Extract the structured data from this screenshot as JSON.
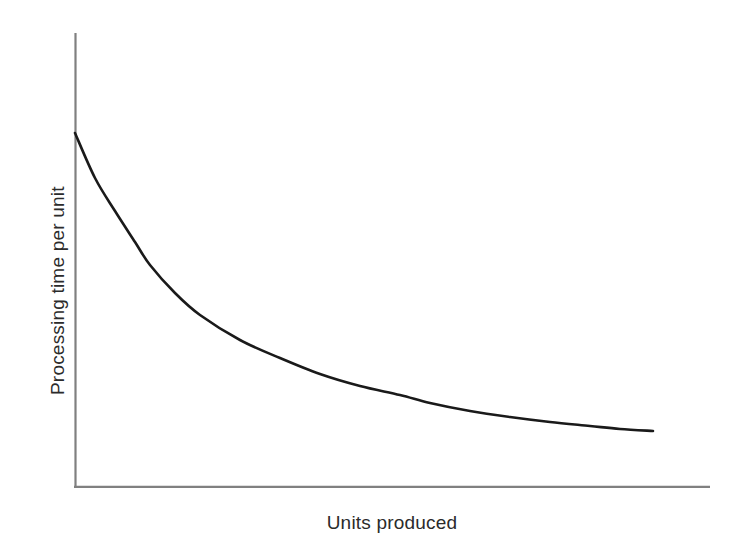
{
  "figure": {
    "background_color": "#ffffff",
    "axis_color": "#808080",
    "curve_color": "#1a1a1a",
    "title": "",
    "y_axis_label": "Processing time per unit",
    "x_axis_label": "Units produced"
  },
  "chart_data": {
    "type": "line",
    "title": "",
    "subtitle": "",
    "xlabel": "Units produced",
    "ylabel": "Processing time per unit",
    "legend": [],
    "legend_position": "none",
    "grid": false,
    "x_tick_labels": [],
    "y_tick_labels": [],
    "xlim": [
      0,
      100
    ],
    "ylim": [
      0,
      100
    ],
    "annotations": [],
    "series": [
      {
        "name": "Learning curve",
        "color": "#1a1a1a",
        "x": [
          0,
          5,
          10,
          15,
          20,
          25,
          30,
          35,
          40,
          45,
          50,
          55,
          60,
          65,
          70,
          75,
          80,
          85,
          90,
          91
        ],
        "y": [
          78,
          68,
          60,
          53,
          46.5,
          41,
          36.5,
          32.5,
          29,
          26.5,
          24.5,
          23,
          21.8,
          20.8,
          20,
          19.4,
          19,
          18.7,
          18.5,
          18.4
        ]
      }
    ],
    "pixel_geometry": {
      "axis_origin": [
        75,
        487
      ],
      "y_axis_top": [
        75,
        33
      ],
      "x_axis_right": [
        710,
        487
      ],
      "curve_points": [
        [
          75,
          133
        ],
        [
          95,
          178
        ],
        [
          115,
          211
        ],
        [
          135,
          242
        ],
        [
          150,
          265
        ],
        [
          175,
          293
        ],
        [
          200,
          315
        ],
        [
          240,
          340
        ],
        [
          280,
          358
        ],
        [
          320,
          374
        ],
        [
          360,
          386
        ],
        [
          400,
          395
        ],
        [
          430,
          403
        ],
        [
          470,
          411
        ],
        [
          510,
          417
        ],
        [
          550,
          422
        ],
        [
          590,
          426
        ],
        [
          620,
          429
        ],
        [
          653,
          431
        ]
      ]
    }
  }
}
